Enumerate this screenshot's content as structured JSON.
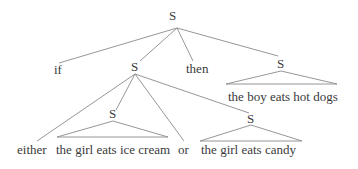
{
  "tree": {
    "root": "S",
    "level1": {
      "if": "if",
      "s": "S",
      "then": "then",
      "s_right": "S"
    },
    "right_leaf": "the boy eats hot dogs",
    "level2": {
      "either": "either",
      "s_left": "S",
      "or": "or",
      "s_right": "S"
    },
    "leaf_left": "the girl eats ice cream",
    "leaf_right": "the girl eats candy"
  }
}
